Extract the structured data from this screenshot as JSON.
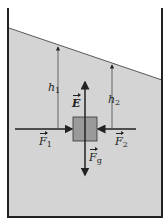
{
  "diagram": {
    "colors": {
      "fluid": "#d4d4d4",
      "block": "#9a9a9a",
      "line": "#222222",
      "wall": "#222222"
    },
    "labels": {
      "h1": {
        "base": "h",
        "sub": "1"
      },
      "h2": {
        "base": "h",
        "sub": "2"
      },
      "E": {
        "base": "E"
      },
      "F1": {
        "base": "F",
        "sub": "1"
      },
      "F2": {
        "base": "F",
        "sub": "2"
      },
      "Fg": {
        "base": "F",
        "sub": "g"
      }
    }
  }
}
